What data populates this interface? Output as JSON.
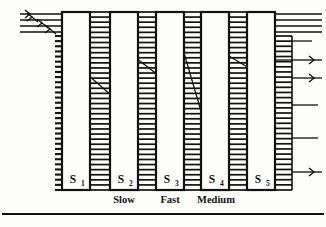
{
  "figure": {
    "name": "multistage-switching-fabric-diagram",
    "background_color": "#fdfdfc",
    "ink_color": "#111111",
    "width": 326,
    "height": 227
  },
  "switches": [
    {
      "id": "S1",
      "label": "S",
      "subscript": "1",
      "x": 62,
      "y": 12,
      "w": 28,
      "h": 178
    },
    {
      "id": "S2",
      "label": "S",
      "subscript": "2",
      "x": 110,
      "y": 12,
      "w": 28,
      "h": 178
    },
    {
      "id": "S3",
      "label": "S",
      "subscript": "3",
      "x": 156,
      "y": 12,
      "w": 28,
      "h": 178
    },
    {
      "id": "S4",
      "label": "S",
      "subscript": "4",
      "x": 201,
      "y": 12,
      "w": 28,
      "h": 178
    },
    {
      "id": "S5",
      "label": "S",
      "subscript": "5",
      "x": 247,
      "y": 12,
      "w": 28,
      "h": 178
    }
  ],
  "speed_labels": [
    {
      "text": "Slow",
      "x": 124,
      "y": 203
    },
    {
      "text": "Fast",
      "x": 170,
      "y": 203
    },
    {
      "text": "Medium",
      "x": 216,
      "y": 203
    }
  ],
  "ladders": [
    {
      "name": "ladder-s1-s2",
      "x1": 90,
      "x2": 110,
      "top": 12,
      "bottom": 190,
      "rungs": 36
    },
    {
      "name": "ladder-s2-s3",
      "x1": 138,
      "x2": 156,
      "top": 12,
      "bottom": 190,
      "rungs": 36
    },
    {
      "name": "ladder-s3-s4",
      "x1": 184,
      "x2": 201,
      "top": 12,
      "bottom": 190,
      "rungs": 36
    },
    {
      "name": "ladder-s4-s5",
      "x1": 229,
      "x2": 247,
      "top": 12,
      "bottom": 190,
      "rungs": 36
    },
    {
      "name": "ladder-s5-out",
      "x1": 275,
      "x2": 292,
      "top": 36,
      "bottom": 190,
      "rungs": 31
    }
  ],
  "left_comb": {
    "name": "left-port-comb",
    "x": 55,
    "x2": 62,
    "top": 36,
    "bottom": 190,
    "ticks": 31
  },
  "input_lines": [
    {
      "y": 14,
      "x1": 20,
      "x2": 62,
      "arrow": true
    },
    {
      "y": 20,
      "x1": 20,
      "x2": 62,
      "arrow": true
    },
    {
      "y": 26,
      "x1": 20,
      "x2": 62,
      "arrow": true
    },
    {
      "y": 32,
      "x1": 20,
      "x2": 62,
      "arrow": true
    }
  ],
  "input_arrow_marks": [
    {
      "x": 32,
      "y": 17
    },
    {
      "x": 42,
      "y": 23
    },
    {
      "x": 50,
      "y": 29
    }
  ],
  "output_lines": [
    {
      "y": 14,
      "x1": 275,
      "x2": 322,
      "arrow": false
    },
    {
      "y": 20,
      "x1": 275,
      "x2": 322,
      "arrow": false
    },
    {
      "y": 26,
      "x1": 275,
      "x2": 322,
      "arrow": false
    },
    {
      "y": 32,
      "x1": 275,
      "x2": 322,
      "arrow": false
    },
    {
      "y": 41,
      "x1": 292,
      "x2": 312,
      "arrow": false
    },
    {
      "y": 60,
      "x1": 292,
      "x2": 322,
      "arrow": true
    },
    {
      "y": 78,
      "x1": 292,
      "x2": 322,
      "arrow": true
    },
    {
      "y": 105,
      "x1": 292,
      "x2": 318,
      "arrow": false
    },
    {
      "y": 138,
      "x1": 292,
      "x2": 318,
      "arrow": false
    },
    {
      "y": 172,
      "x1": 292,
      "x2": 322,
      "arrow": true
    }
  ],
  "internal_links": [
    {
      "from": "S1",
      "x1": 64,
      "y1": 16,
      "x2": 88,
      "y2": 32
    },
    {
      "from": "S1",
      "x1": 64,
      "y1": 30,
      "x2": 88,
      "y2": 16
    },
    {
      "from": "S1",
      "x1": 64,
      "y1": 26,
      "x2": 89,
      "y2": 27
    },
    {
      "from": "S1",
      "x1": 68,
      "y1": 30,
      "x2": 89,
      "y2": 128
    },
    {
      "from": "S1",
      "x1": 68,
      "y1": 30,
      "x2": 80,
      "y2": 131
    },
    {
      "from": "S1",
      "x1": 64,
      "y1": 27,
      "x2": 78,
      "y2": 131
    },
    {
      "from": "S2",
      "x1": 112,
      "y1": 17,
      "x2": 136,
      "y2": 132
    },
    {
      "from": "S2",
      "x1": 112,
      "y1": 24,
      "x2": 120,
      "y2": 83
    },
    {
      "from": "S2",
      "x1": 120,
      "y1": 83,
      "x2": 136,
      "y2": 98
    },
    {
      "from": "S2",
      "x1": 136,
      "y1": 76,
      "x2": 112,
      "y2": 100
    },
    {
      "from": "S3",
      "x1": 158,
      "y1": 135,
      "x2": 182,
      "y2": 68
    },
    {
      "from": "S3",
      "x1": 158,
      "y1": 72,
      "x2": 182,
      "y2": 100
    },
    {
      "from": "S3",
      "x1": 158,
      "y1": 92,
      "x2": 182,
      "y2": 78
    },
    {
      "from": "S3",
      "x1": 182,
      "y1": 120,
      "x2": 158,
      "y2": 168
    },
    {
      "from": "S4",
      "x1": 203,
      "y1": 38,
      "x2": 227,
      "y2": 130
    },
    {
      "from": "S4",
      "x1": 203,
      "y1": 178,
      "x2": 227,
      "y2": 60
    },
    {
      "from": "S4",
      "x1": 227,
      "y1": 92,
      "x2": 203,
      "y2": 178
    },
    {
      "from": "S5",
      "x1": 249,
      "y1": 52,
      "x2": 273,
      "y2": 88
    },
    {
      "from": "S5",
      "x1": 249,
      "y1": 143,
      "x2": 273,
      "y2": 132
    },
    {
      "from": "S5",
      "x1": 249,
      "y1": 160,
      "x2": 273,
      "y2": 152
    },
    {
      "from": "S5",
      "x1": 249,
      "y1": 160,
      "x2": 273,
      "y2": 160
    }
  ],
  "long_links": [
    {
      "x1": 88,
      "y1": 75,
      "x2": 112,
      "y2": 96
    },
    {
      "x1": 136,
      "y1": 58,
      "x2": 158,
      "y2": 75
    },
    {
      "x1": 182,
      "y1": 46,
      "x2": 203,
      "y2": 118
    },
    {
      "x1": 229,
      "y1": 56,
      "x2": 249,
      "y2": 68
    },
    {
      "x1": 275,
      "y1": 60,
      "x2": 292,
      "y2": 60
    }
  ],
  "footer_rule": {
    "name": "footer-divider",
    "y": 214,
    "x1": 2,
    "x2": 324
  }
}
